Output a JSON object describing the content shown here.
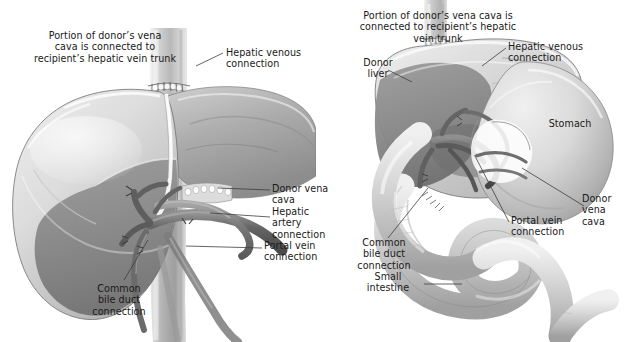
{
  "figure": {
    "type": "medical-illustration",
    "style": "grayscale airbrush rendering",
    "panel_count": 2,
    "background_color": "#ffffff",
    "text_color": "#1a1a1a",
    "leader_line_color": "#3d3d3d"
  },
  "palette": {
    "liver_top_light": "#dedede",
    "liver_top_mid": "#c9c9c9",
    "liver_underside": "#8c8c8c",
    "liver_shadow": "#6f6f6f",
    "vena_cava": "#c4c4c4",
    "vessel_dark": "#5f5f5f",
    "stomach_light": "#dcdcdc",
    "stomach_shade": "#a8a8a8",
    "intestine_light": "#e2e2e2",
    "intestine_shade": "#b0b0b0",
    "outline": "#6a6a6a",
    "white": "#ffffff"
  },
  "left_panel": {
    "name": "donor-liver-in-place-view",
    "labels": [
      {
        "id": "portion-vena-cava",
        "lines": [
          "Portion of donor’s vena",
          "cava is connected to",
          "recipient’s hepatic vein trunk"
        ],
        "align": "center",
        "x": 14,
        "y": 30,
        "width": 182,
        "has_leader": false
      },
      {
        "id": "hepatic-venous-connection",
        "lines": [
          "Hepatic venous",
          "connection"
        ],
        "align": "left",
        "x": 226,
        "y": 47,
        "width": 88,
        "has_leader": true
      },
      {
        "id": "donor-vena-cava",
        "lines": [
          "Donor vena",
          "cava"
        ],
        "align": "left",
        "x": 272,
        "y": 183,
        "width": 60,
        "has_leader": true
      },
      {
        "id": "hepatic-artery-connection",
        "lines": [
          "Hepatic",
          "artery",
          "connection"
        ],
        "align": "left",
        "x": 272,
        "y": 206,
        "width": 60,
        "has_leader": true
      },
      {
        "id": "portal-vein-connection",
        "lines": [
          "Portal vein",
          "connection"
        ],
        "align": "left",
        "x": 264,
        "y": 240,
        "width": 66,
        "has_leader": true
      },
      {
        "id": "common-bile-duct-connection",
        "lines": [
          "Common",
          "bile duct",
          "connection"
        ],
        "align": "center",
        "x": 82,
        "y": 283,
        "width": 74,
        "has_leader": true
      }
    ]
  },
  "right_panel": {
    "name": "donor-liver-with-stomach-and-intestine-view",
    "labels": [
      {
        "id": "portion-vena-cava",
        "lines": [
          "Portion of donor’s vena cava is",
          "connected to recipient’s hepatic",
          "vein trunk"
        ],
        "align": "center",
        "x": 349,
        "y": 10,
        "width": 178,
        "has_leader": false
      },
      {
        "id": "hepatic-venous-connection",
        "lines": [
          "Hepatic venous",
          "connection"
        ],
        "align": "left",
        "x": 508,
        "y": 41,
        "width": 88,
        "has_leader": true
      },
      {
        "id": "donor-liver",
        "lines": [
          "Donor",
          "liver"
        ],
        "align": "center",
        "x": 354,
        "y": 57,
        "width": 48,
        "has_leader": true
      },
      {
        "id": "stomach",
        "lines": [
          "Stomach"
        ],
        "align": "center",
        "x": 543,
        "y": 118,
        "width": 54,
        "has_leader": false
      },
      {
        "id": "donor-vena-cava",
        "lines": [
          "Donor",
          "vena",
          "cava"
        ],
        "align": "left",
        "x": 582,
        "y": 193,
        "width": 44,
        "has_leader": true
      },
      {
        "id": "portal-vein-connection",
        "lines": [
          "Portal vein",
          "connection"
        ],
        "align": "left",
        "x": 511,
        "y": 215,
        "width": 66,
        "has_leader": true
      },
      {
        "id": "common-bile-duct-connection",
        "lines": [
          "Common",
          "bile duct",
          "connection"
        ],
        "align": "center",
        "x": 347,
        "y": 237,
        "width": 74,
        "has_leader": true
      },
      {
        "id": "small-intestine",
        "lines": [
          "Small",
          "intestine"
        ],
        "align": "center",
        "x": 355,
        "y": 271,
        "width": 66,
        "has_leader": true
      }
    ]
  }
}
